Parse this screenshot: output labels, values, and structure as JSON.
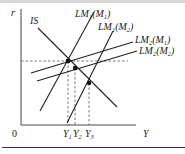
{
  "diagram": {
    "type": "IS-LM",
    "axes": {
      "y_label": "r",
      "x_label": "Y",
      "origin_label": "0"
    },
    "curves": [
      {
        "name": "IS",
        "label": "IS",
        "slope": "downward"
      },
      {
        "name": "LM1(M1)",
        "label_main": "LM",
        "label_sub": "1",
        "label_arg": "M",
        "label_arg_sub": "1",
        "slope": "steep upward"
      },
      {
        "name": "LM1(M2)",
        "label_main": "LM",
        "label_sub": "1",
        "label_arg": "M",
        "label_arg_sub": "2",
        "slope": "steep upward"
      },
      {
        "name": "LM2(M1)",
        "label_main": "LM",
        "label_sub": "2",
        "label_arg": "M",
        "label_arg_sub": "1",
        "slope": "flat upward"
      },
      {
        "name": "LM2(M2)",
        "label_main": "LM",
        "label_sub": "2",
        "label_arg": "M",
        "label_arg_sub": "2",
        "slope": "flat upward"
      }
    ],
    "equilibria": [
      {
        "label": "Y",
        "sub": "1"
      },
      {
        "label": "Y",
        "sub": "2"
      },
      {
        "label": "Y",
        "sub": "3"
      }
    ]
  }
}
